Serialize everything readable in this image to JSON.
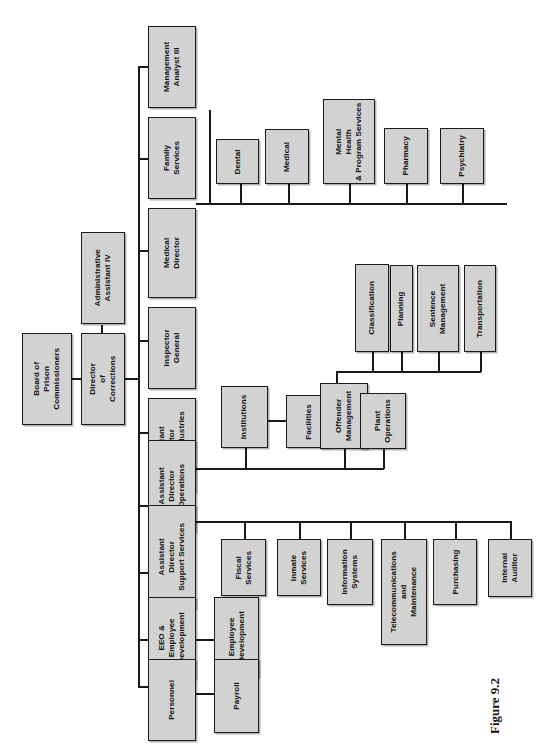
{
  "figure": {
    "caption": "Figure 9.2",
    "orientation": "rotated-90-ccw",
    "box_fill_color": "#d2d2d2",
    "box_border_color": "#1a1a1a",
    "background_color": "#ffffff"
  },
  "chart_data": {
    "type": "diagram",
    "subtype": "organization-chart",
    "title": "Figure 9.2",
    "nodes": [
      {
        "id": "board",
        "label": "Board of\nPrison\nCommissioners",
        "level": 0,
        "parent": null
      },
      {
        "id": "director",
        "label": "Director\nof\nCorrections",
        "level": 1,
        "parent": "board"
      },
      {
        "id": "admin_asst",
        "label": "Administrative\nAssistant IV",
        "level": 1,
        "parent": "director"
      },
      {
        "id": "mgmt_analyst",
        "label": "Management\nAnalyst III",
        "level": 2,
        "parent": "director"
      },
      {
        "id": "family_services",
        "label": "Family\nServices",
        "level": 2,
        "parent": "director"
      },
      {
        "id": "medical_director",
        "label": "Medical\nDirector",
        "level": 2,
        "parent": "director"
      },
      {
        "id": "inspector_general",
        "label": "Inspector\nGeneral",
        "level": 2,
        "parent": "director"
      },
      {
        "id": "ad_prison_ind",
        "label": "Assistant\nDirector\nPrison Industries",
        "level": 2,
        "parent": "director"
      },
      {
        "id": "ad_operations",
        "label": "Assistant\nDirector\nOperations",
        "level": 2,
        "parent": "director"
      },
      {
        "id": "ad_support",
        "label": "Assistant\nDirector\nSupport Services",
        "level": 2,
        "parent": "director"
      },
      {
        "id": "eeo",
        "label": "EEO &\nEmployee\nDevelopment",
        "level": 2,
        "parent": "director"
      },
      {
        "id": "personnel",
        "label": "Personnel",
        "level": 2,
        "parent": "director"
      },
      {
        "id": "dental",
        "label": "Dental",
        "level": 3,
        "parent": "medical_director"
      },
      {
        "id": "medical",
        "label": "Medical",
        "level": 3,
        "parent": "medical_director"
      },
      {
        "id": "mental_health",
        "label": "Mental\nHealth\n& Program Services",
        "level": 3,
        "parent": "medical_director"
      },
      {
        "id": "pharmacy",
        "label": "Pharmacy",
        "level": 3,
        "parent": "medical_director"
      },
      {
        "id": "psychiatry",
        "label": "Psychiatry",
        "level": 3,
        "parent": "medical_director"
      },
      {
        "id": "institutions",
        "label": "Institutions",
        "level": 3,
        "parent": "ad_operations"
      },
      {
        "id": "facilities",
        "label": "Facilities",
        "level": 4,
        "parent": "institutions"
      },
      {
        "id": "offender_mgmt",
        "label": "Offender\nManagement",
        "level": 3,
        "parent": "ad_operations"
      },
      {
        "id": "plant_ops",
        "label": "Plant\nOperations",
        "level": 3,
        "parent": "ad_operations"
      },
      {
        "id": "classification",
        "label": "Classification",
        "level": 4,
        "parent": "offender_mgmt"
      },
      {
        "id": "planning",
        "label": "Planning",
        "level": 4,
        "parent": "offender_mgmt"
      },
      {
        "id": "sentence_mgmt",
        "label": "Sentence\nManagement",
        "level": 4,
        "parent": "offender_mgmt"
      },
      {
        "id": "transportation",
        "label": "Transportation",
        "level": 4,
        "parent": "offender_mgmt"
      },
      {
        "id": "fiscal_services",
        "label": "Fiscal\nServices",
        "level": 3,
        "parent": "ad_support"
      },
      {
        "id": "inmate_services",
        "label": "Inmate\nServices",
        "level": 3,
        "parent": "ad_support"
      },
      {
        "id": "info_systems",
        "label": "Information\nSystems",
        "level": 3,
        "parent": "ad_support"
      },
      {
        "id": "telecom",
        "label": "Telecommunications\nand\nMaintenance",
        "level": 3,
        "parent": "ad_support"
      },
      {
        "id": "purchasing",
        "label": "Purchasing",
        "level": 3,
        "parent": "ad_support"
      },
      {
        "id": "internal_auditor",
        "label": "Internal\nAuditor",
        "level": 3,
        "parent": "ad_support"
      },
      {
        "id": "employee_dev",
        "label": "Employee\nDevelopment",
        "level": 3,
        "parent": "eeo"
      },
      {
        "id": "payroll",
        "label": "Payroll",
        "level": 3,
        "parent": "personnel"
      }
    ]
  },
  "boxes": {
    "board": {
      "text": "Board of\nPrison\nCommissioners"
    },
    "director": {
      "text": "Director\nof\nCorrections"
    },
    "admin_asst": {
      "text": "Administrative\nAssistant IV"
    },
    "mgmt_analyst": {
      "text": "Management\nAnalyst III"
    },
    "family_services": {
      "text": "Family\nServices"
    },
    "medical_director": {
      "text": "Medical\nDirector"
    },
    "inspector_general": {
      "text": "Inspector\nGeneral"
    },
    "ad_prison_ind": {
      "text": "Assistant\nDirector\nPrison Industries"
    },
    "ad_operations": {
      "text": "Assistant\nDirector\nOperations"
    },
    "ad_support": {
      "text": "Assistant\nDirector\nSupport Services"
    },
    "eeo": {
      "text": "EEO &\nEmployee\nDevelopment"
    },
    "personnel": {
      "text": "Personnel"
    },
    "dental": {
      "text": "Dental"
    },
    "medical": {
      "text": "Medical"
    },
    "mental_health": {
      "text": "Mental\nHealth\n& Program Services"
    },
    "pharmacy": {
      "text": "Pharmacy"
    },
    "psychiatry": {
      "text": "Psychiatry"
    },
    "institutions": {
      "text": "Institutions"
    },
    "facilities": {
      "text": "Facilities"
    },
    "offender_mgmt": {
      "text": "Offender\nManagement"
    },
    "plant_ops": {
      "text": "Plant\nOperations"
    },
    "classification": {
      "text": "Classification"
    },
    "planning": {
      "text": "Planning"
    },
    "sentence_mgmt": {
      "text": "Sentence\nManagement"
    },
    "transportation": {
      "text": "Transportation"
    },
    "fiscal_services": {
      "text": "Fiscal\nServices"
    },
    "inmate_services": {
      "text": "Inmate\nServices"
    },
    "info_systems": {
      "text": "Information\nSystems"
    },
    "telecom": {
      "text": "Telecommunications\nand\nMaintenance"
    },
    "purchasing": {
      "text": "Purchasing"
    },
    "internal_auditor": {
      "text": "Internal\nAuditor"
    },
    "employee_dev": {
      "text": "Employee\nDevelopment"
    },
    "payroll": {
      "text": "Payroll"
    }
  }
}
